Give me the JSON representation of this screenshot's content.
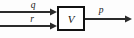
{
  "diagram": {
    "type": "block-diagram",
    "background_color": "#fdfdfd",
    "line_color": "#2b2b2b",
    "block": {
      "label": "V",
      "x": 57,
      "y": 6,
      "width": 28,
      "height": 25,
      "border_color": "#111111",
      "border_width": 2,
      "fill_color": "#ffffff"
    },
    "inputs": [
      {
        "label": "q",
        "label_x": 33,
        "label_y": 8,
        "line_y": 12,
        "line_x_start": 0,
        "line_x_end": 57
      },
      {
        "label": "r",
        "label_x": 32,
        "label_y": 22,
        "line_y": 26,
        "line_x_start": 0,
        "line_x_end": 57
      }
    ],
    "outputs": [
      {
        "label": "p",
        "label_x": 100,
        "label_y": 13,
        "line_y": 19,
        "line_x_start": 85,
        "line_x_end": 132
      }
    ]
  }
}
